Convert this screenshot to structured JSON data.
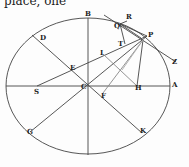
{
  "caption": "place, one",
  "diagram": {
    "shape": "ellipse",
    "points": {
      "A": "A",
      "B": "B",
      "C": "C",
      "D": "D",
      "E": "E",
      "F": "F",
      "G": "G",
      "H": "H",
      "I": "I",
      "K": "K",
      "P": "P",
      "Q": "Q",
      "R": "R",
      "S": "S",
      "T": "T",
      "Z": "Z",
      "v": "v",
      "x": "x"
    },
    "stroke_color": "#444444"
  }
}
